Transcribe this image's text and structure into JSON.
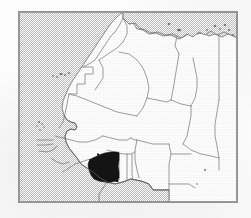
{
  "document": {
    "kind": "locator-map",
    "title": "Côte d'Ivoire location map",
    "caption": "",
    "alt_text": "Map of western and northern Africa with Côte d'Ivoire shaded black"
  },
  "map": {
    "region_label": "West Africa and the Sahara",
    "projection_note": "",
    "frame": {
      "x": 18,
      "y": 11,
      "width": 220,
      "height": 192
    },
    "highlighted_country": "Côte d'Ivoire",
    "highlight_color": "#111111",
    "land_color": "#ffffff",
    "water_color": "#c9c9c9",
    "border_color": "#777777",
    "coast_color": "#6b6b6b",
    "frame_color": "#949494",
    "water_bodies": [
      "Atlantic Ocean",
      "Mediterranean Sea",
      "Gulf of Guinea"
    ],
    "island_groups": [
      "Canary Islands",
      "Cape Verde",
      "Aegean Islands"
    ],
    "countries_visible": [
      "Morocco",
      "Western Sahara",
      "Algeria",
      "Tunisia",
      "Libya",
      "Egypt",
      "Mauritania",
      "Mali",
      "Niger",
      "Chad",
      "Senegal",
      "Gambia",
      "Guinea-Bissau",
      "Guinea",
      "Sierra Leone",
      "Liberia",
      "Côte d'Ivoire",
      "Burkina Faso",
      "Ghana",
      "Togo",
      "Benin",
      "Nigeria",
      "Cameroon",
      "Central African Republic",
      "Sudan"
    ]
  }
}
